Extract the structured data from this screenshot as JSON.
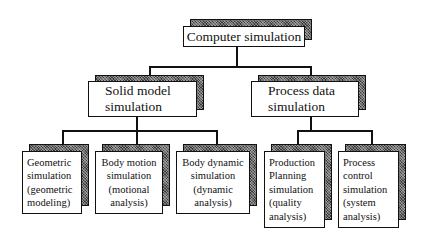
{
  "diagram": {
    "type": "hierarchy-tree",
    "root": {
      "label": "Computer simulation"
    },
    "level2": [
      {
        "id": "solid",
        "lines": [
          "Solid model",
          "simulation"
        ]
      },
      {
        "id": "process",
        "lines": [
          "Process data",
          "simulation"
        ]
      }
    ],
    "level3": [
      {
        "parent": "solid",
        "lines": [
          "Geometric",
          "simulation",
          "(geometric",
          "modeling)"
        ]
      },
      {
        "parent": "solid",
        "lines": [
          "Body motion",
          "simulation",
          "(motional",
          "analysis)"
        ]
      },
      {
        "parent": "solid",
        "lines": [
          "Body dynamic",
          "simulation",
          "(dynamic",
          "analysis)"
        ]
      },
      {
        "parent": "process",
        "lines": [
          "Production",
          "Planning",
          "simulation",
          "(quality",
          "analysis)"
        ]
      },
      {
        "parent": "process",
        "lines": [
          "Process",
          "control",
          "simulation",
          "(system",
          "analysis)"
        ]
      }
    ],
    "colors": {
      "line": "#111111",
      "box_fill": "#ffffff",
      "shadow": "#6a6a6a"
    }
  }
}
